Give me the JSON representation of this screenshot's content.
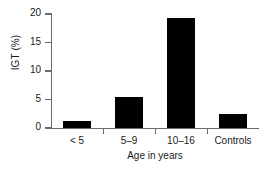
{
  "chart_data": {
    "type": "bar",
    "title": "",
    "subtitle": "",
    "categories": [
      "< 5",
      "5–9",
      "10–16",
      "Controls"
    ],
    "values": [
      1.2,
      5.4,
      19.3,
      2.5
    ],
    "series": [
      {
        "name": "IGT",
        "values": [
          1.2,
          5.4,
          19.3,
          2.5
        ]
      }
    ],
    "xlabel": "Age in years",
    "ylabel": "IGT (%)",
    "ylim": [
      0,
      20
    ],
    "yticks": [
      0,
      5,
      10,
      15,
      20
    ],
    "ytick_labels": [
      "0",
      "5",
      "10",
      "15",
      "20"
    ],
    "grid": false,
    "legend": false,
    "legend_position": "none",
    "bar_color": "#000000",
    "axis_color": "#6b6b6b",
    "text_color": "#1a1a1a",
    "background_color": "#ffffff",
    "annotations": []
  }
}
